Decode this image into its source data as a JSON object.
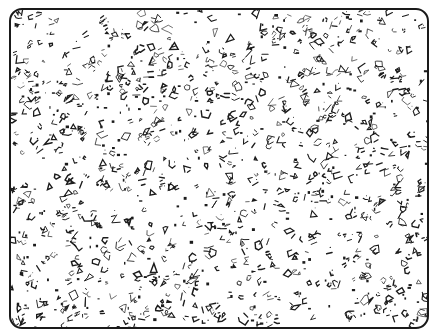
{
  "figure": {
    "frame": {
      "border_color": "#1a1a1a",
      "background": "#ffffff",
      "corner_radius": 13
    },
    "pattern": {
      "ink_color": "#1c1c1c",
      "seed": 7331,
      "blob_count": 900,
      "dot_count": 260,
      "density_note": "uniformly scattered, slightly denser clusters throughout"
    }
  }
}
